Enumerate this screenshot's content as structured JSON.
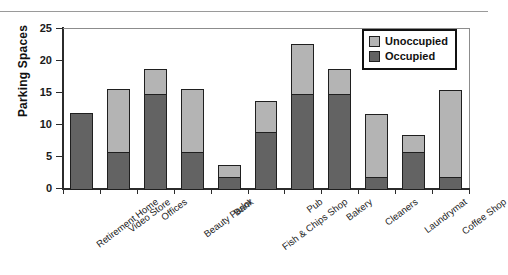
{
  "chart_data": {
    "type": "bar",
    "subtype": "stacked-vertical",
    "title": "",
    "xlabel": "",
    "ylabel": "Parking Spaces",
    "ylim": [
      0,
      25
    ],
    "yticks": [
      0,
      5,
      10,
      15,
      20,
      25
    ],
    "grid": false,
    "legend_position": "top-right",
    "categories": [
      "Retirement Home",
      "Video Store",
      "Offices",
      "Beauty Parlor",
      "Bank",
      "Fish & Chips Shop",
      "Pub",
      "Bakery",
      "Cleaners",
      "Laundrymat",
      "Coffee Shop"
    ],
    "series": [
      {
        "name": "Occupied",
        "color": "#636363",
        "values": [
          12,
          6,
          15,
          6,
          2,
          9,
          15,
          15,
          2,
          6,
          2
        ]
      },
      {
        "name": "Unoccupied",
        "color": "#b4b4b4",
        "values": [
          0,
          10,
          4,
          10,
          2,
          5,
          8,
          4,
          10,
          2.8,
          13.8
        ]
      }
    ],
    "totals": [
      12,
      16,
      19,
      16,
      4,
      14,
      23,
      19,
      12,
      8.8,
      15.8
    ]
  },
  "legend": {
    "items": [
      {
        "label": "Unoccupied",
        "color": "#b4b4b4"
      },
      {
        "label": "Occupied",
        "color": "#636363"
      }
    ]
  },
  "axes": {
    "y_label": "Parking Spaces",
    "y_tick_labels": [
      "25",
      "20",
      "15",
      "10",
      "5",
      "0"
    ]
  },
  "artifacts": {
    "top_cut_text": "",
    "bottom_cut_text": ""
  }
}
